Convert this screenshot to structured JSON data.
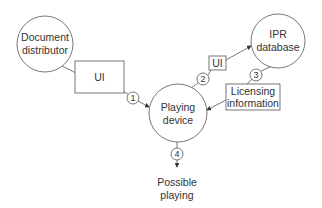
{
  "diagram": {
    "nodes": {
      "document_distributor": {
        "line1": "Document",
        "line2": "distributor"
      },
      "ipr_database": {
        "line1": "IPR",
        "line2": "database"
      },
      "playing_device": {
        "line1": "Playing",
        "line2": "device"
      },
      "possible_playing": {
        "line1": "Possible",
        "line2": "playing"
      }
    },
    "boxes": {
      "ui_main": "UI",
      "ui_small": "UI",
      "licensing": {
        "line1": "Licensing",
        "line2": "information"
      }
    },
    "steps": [
      "1",
      "2",
      "3",
      "4"
    ],
    "colors": {
      "stroke": "#555555",
      "text": "#333333",
      "background": "#ffffff"
    }
  }
}
